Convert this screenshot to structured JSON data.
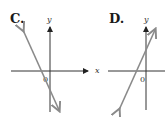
{
  "graphs": [
    {
      "label": "C.",
      "axis_x_label": "x",
      "axis_y_label": "y",
      "origin_label": "0",
      "line": {
        "slope_sign": "negative",
        "description": "steep line with negative slope crossing x-axis left of origin and y-axis below origin"
      }
    },
    {
      "label": "D.",
      "axis_x_label": "x",
      "axis_y_label": "y",
      "origin_label": "0",
      "line": {
        "slope_sign": "positive",
        "description": "steep line with positive slope crossing x-axis left of origin and y-axis above origin"
      }
    }
  ],
  "colors": {
    "axis": "#333333",
    "line": "#8a8a8a",
    "text": "#1a1a1a"
  }
}
